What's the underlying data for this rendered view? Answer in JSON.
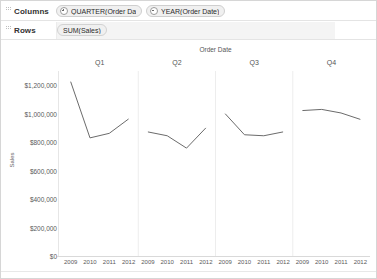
{
  "shelves": [
    {
      "name": "columns",
      "label": "Columns",
      "pills": [
        {
          "text": "QUARTER(Order Dat..",
          "mark": "plus"
        },
        {
          "text": "YEAR(Order Date)",
          "mark": "minus"
        }
      ]
    },
    {
      "name": "rows",
      "label": "Rows",
      "pills": [
        {
          "text": "SUM(Sales)",
          "mark": "none"
        }
      ]
    }
  ],
  "chart_data": {
    "type": "line",
    "title": "",
    "xlabel": "Order Date",
    "ylabel": "Sales",
    "column_title": "Order Date",
    "panels": [
      "Q1",
      "Q2",
      "Q3",
      "Q4"
    ],
    "x": [
      "2009",
      "2010",
      "2011",
      "2012"
    ],
    "categories": [
      "2009",
      "2010",
      "2011",
      "2012"
    ],
    "ylim": [
      0,
      1300000
    ],
    "ytick_values": [
      1200000,
      1000000,
      800000,
      600000,
      400000,
      200000,
      0
    ],
    "ytick_labels": [
      "$1,200,000",
      "$1,000,000",
      "$800,000",
      "$600,000",
      "$400,000",
      "$200,000",
      "$0"
    ],
    "grid": false,
    "legend": "none",
    "series": [
      {
        "name": "Q1",
        "values": [
          1225000,
          830000,
          862000,
          963000
        ]
      },
      {
        "name": "Q2",
        "values": [
          872000,
          845000,
          758000,
          900000
        ]
      },
      {
        "name": "Q3",
        "values": [
          1000000,
          852000,
          845000,
          872000
        ]
      },
      {
        "name": "Q4",
        "values": [
          1022000,
          1030000,
          1005000,
          960000
        ]
      }
    ],
    "line_color": "#6b6b6b"
  }
}
